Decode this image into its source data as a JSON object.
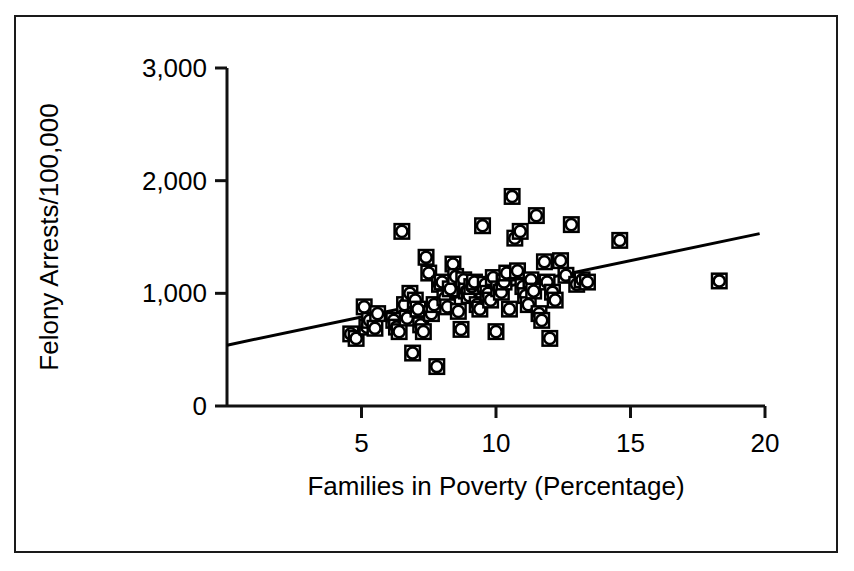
{
  "chart_data": {
    "type": "scatter",
    "title": "",
    "xlabel": "Families in Poverty (Percentage)",
    "ylabel": "Felony Arrests/100,000",
    "xlim": [
      0,
      20
    ],
    "ylim": [
      0,
      3000
    ],
    "xticks": [
      5,
      10,
      15,
      20
    ],
    "xtick_labels": [
      "5",
      "10",
      "15",
      "20"
    ],
    "yticks": [
      0,
      1000,
      2000,
      3000
    ],
    "ytick_labels": [
      "0",
      "1,000",
      "2,000",
      "3,000"
    ],
    "grid": false,
    "legend": null,
    "marker_style": "square-outline-with-circle",
    "marker_color": "#000000",
    "series": [
      {
        "name": "Counties",
        "points": [
          [
            4.6,
            640
          ],
          [
            4.8,
            600
          ],
          [
            5.1,
            880
          ],
          [
            5.2,
            700
          ],
          [
            5.3,
            760
          ],
          [
            5.5,
            690
          ],
          [
            5.6,
            820
          ],
          [
            6.2,
            760
          ],
          [
            6.3,
            700
          ],
          [
            6.4,
            660
          ],
          [
            6.5,
            1550
          ],
          [
            6.6,
            900
          ],
          [
            6.7,
            780
          ],
          [
            6.8,
            1000
          ],
          [
            6.9,
            470
          ],
          [
            7.0,
            940
          ],
          [
            7.1,
            860
          ],
          [
            7.2,
            720
          ],
          [
            7.3,
            660
          ],
          [
            7.4,
            1320
          ],
          [
            7.5,
            1180
          ],
          [
            7.6,
            820
          ],
          [
            7.7,
            900
          ],
          [
            7.8,
            350
          ],
          [
            7.9,
            1080
          ],
          [
            8.0,
            1100
          ],
          [
            8.1,
            960
          ],
          [
            8.2,
            880
          ],
          [
            8.3,
            1040
          ],
          [
            8.4,
            1260
          ],
          [
            8.5,
            1150
          ],
          [
            8.6,
            840
          ],
          [
            8.7,
            680
          ],
          [
            8.8,
            1120
          ],
          [
            8.9,
            1020
          ],
          [
            9.0,
            980
          ],
          [
            9.1,
            1060
          ],
          [
            9.2,
            1100
          ],
          [
            9.3,
            900
          ],
          [
            9.4,
            860
          ],
          [
            9.5,
            1600
          ],
          [
            9.6,
            1080
          ],
          [
            9.7,
            1000
          ],
          [
            9.8,
            940
          ],
          [
            9.9,
            1140
          ],
          [
            10.0,
            660
          ],
          [
            10.1,
            1040
          ],
          [
            10.2,
            1010
          ],
          [
            10.3,
            1100
          ],
          [
            10.4,
            1180
          ],
          [
            10.5,
            860
          ],
          [
            10.6,
            1860
          ],
          [
            10.7,
            1490
          ],
          [
            10.8,
            1200
          ],
          [
            10.9,
            1550
          ],
          [
            11.0,
            1060
          ],
          [
            11.1,
            980
          ],
          [
            11.2,
            900
          ],
          [
            11.3,
            1120
          ],
          [
            11.4,
            1020
          ],
          [
            11.5,
            1690
          ],
          [
            11.6,
            820
          ],
          [
            11.7,
            760
          ],
          [
            11.8,
            1280
          ],
          [
            11.9,
            1100
          ],
          [
            12.0,
            600
          ],
          [
            12.1,
            1010
          ],
          [
            12.2,
            940
          ],
          [
            12.4,
            1290
          ],
          [
            12.6,
            1160
          ],
          [
            12.8,
            1610
          ],
          [
            13.0,
            1080
          ],
          [
            13.2,
            1120
          ],
          [
            13.4,
            1100
          ],
          [
            14.6,
            1470
          ],
          [
            18.3,
            1110
          ]
        ]
      }
    ],
    "trendline": {
      "x0": 0.0,
      "y0": 540,
      "x1": 19.8,
      "y1": 1530,
      "color": "#000000",
      "width": 3
    }
  }
}
